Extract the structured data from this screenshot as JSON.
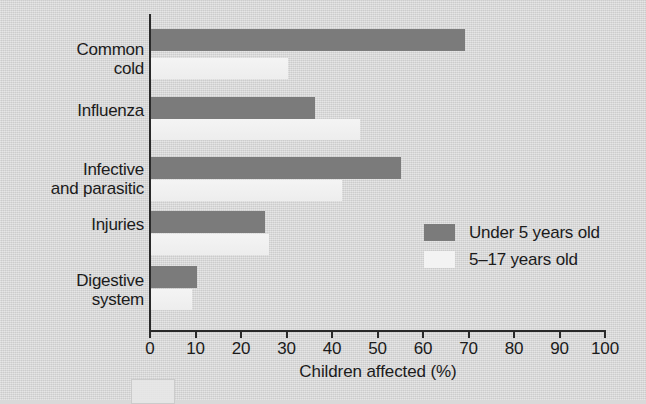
{
  "chart_data": {
    "type": "bar",
    "orientation": "horizontal",
    "title": "",
    "xlabel": "Children affected (%)",
    "ylabel": "",
    "xlim": [
      0,
      100
    ],
    "xticks": [
      0,
      10,
      20,
      30,
      40,
      50,
      60,
      70,
      80,
      90,
      100
    ],
    "grid": false,
    "legend_position": "middle-right",
    "categories": [
      "Common\ncold",
      "Influenza",
      "Infective\nand parasitic",
      "Injuries",
      "Digestive\nsystem"
    ],
    "series": [
      {
        "name": "Under 5 years old",
        "color": "#7b7b7b",
        "values": [
          69,
          36,
          55,
          25,
          10
        ]
      },
      {
        "name": "5–17 years old",
        "color": "#f2f2f2",
        "values": [
          30,
          46,
          42,
          26,
          9
        ]
      }
    ]
  },
  "axis": {
    "x_title": "Children affected (%)",
    "tick_labels": [
      "0",
      "10",
      "20",
      "30",
      "40",
      "50",
      "60",
      "70",
      "80",
      "90",
      "100"
    ]
  },
  "legend": {
    "items": [
      {
        "label": "Under 5 years old",
        "swatch": "dark"
      },
      {
        "label": "5–17 years old",
        "swatch": "light"
      }
    ]
  },
  "colors": {
    "background": "#d9d9d9",
    "axis": "#2a2a2a",
    "series_under5": "#7b7b7b",
    "series_5to17": "#f2f2f2",
    "text": "#1b1b1b"
  }
}
